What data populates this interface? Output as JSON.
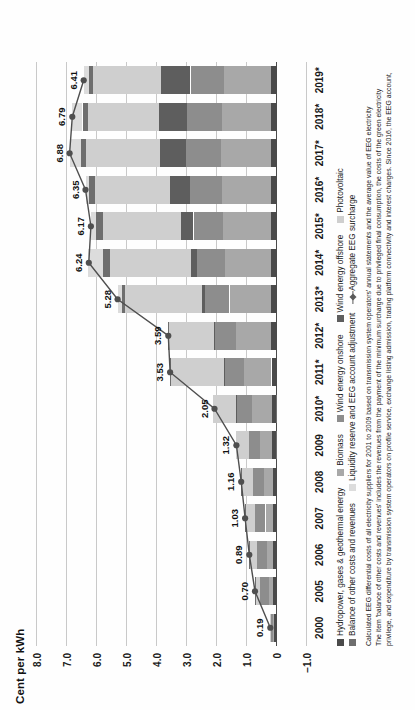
{
  "axis_title": "Cent per kWh",
  "legend": {
    "rows": [
      [
        {
          "label": "Hydropower, gases & geothermal energy",
          "color": "#4a4a4a",
          "type": "swatch"
        },
        {
          "label": "Biomass",
          "color": "#a8a8a8",
          "type": "swatch"
        },
        {
          "label": "Wind energy onshore",
          "color": "#8d8d8d",
          "type": "swatch"
        },
        {
          "label": "Wind energy offshore",
          "color": "#5e5e5e",
          "type": "swatch"
        },
        {
          "label": "Photovoltaic",
          "color": "#cfcfcf",
          "type": "swatch"
        }
      ],
      [
        {
          "label": "Balance of other costs and revenues",
          "color": "#6e6e6e",
          "type": "swatch"
        },
        {
          "label": "Liquidity reserve and EEG account adjustment",
          "color": "#dcdcdc",
          "type": "swatch"
        },
        {
          "label": "Aggregate EEG surcharge",
          "color": "#5a5a5a",
          "type": "diamond"
        }
      ]
    ]
  },
  "footnote": {
    "line1": "Calculated EEG differential costs of all electricity suppliers for 2001 to 2009 based on transmission system operators' annual statements and the average value of EEG electricity",
    "line2": "The item 'balance of other costs and revenues' includes the revenues from the payment of the minimum surcharge due to privileged final consumption, the costs of the green electricity",
    "line3": "privilege, and expenditure by transmission system operators on profile service, exchange listing admission, trading platform connectivity and interest charges. Since 2016, the EEG account,"
  },
  "chart_data": {
    "type": "bar",
    "title": "Cent per kWh",
    "xlabel": "",
    "ylabel": "Cent per kWh",
    "ylim": [
      -1.0,
      8.0
    ],
    "yticks": [
      "8.0",
      "7.0",
      "6.0",
      "5.0",
      "4.0",
      "3.0",
      "2.0",
      "1.0",
      "0",
      "−1.0"
    ],
    "ytick_values": [
      8.0,
      7.0,
      6.0,
      5.0,
      4.0,
      3.0,
      2.0,
      1.0,
      0,
      -1.0
    ],
    "grid": true,
    "legend_position": "below",
    "categories": [
      "2000",
      "2005",
      "2006",
      "2007",
      "2008",
      "2009",
      "2010*",
      "2011*",
      "2012*",
      "2013*",
      "2014*",
      "2015*",
      "2016*",
      "2017*",
      "2018*",
      "2019*"
    ],
    "series": [
      {
        "name": "Hydropower, gases & geothermal energy",
        "color": "#4a4a4a",
        "values": [
          0.06,
          0.1,
          0.11,
          0.11,
          0.11,
          0.12,
          0.14,
          0.15,
          0.16,
          0.17,
          0.18,
          0.18,
          0.18,
          0.18,
          0.18,
          0.17
        ]
      },
      {
        "name": "Biomass",
        "color": "#a8a8a8",
        "values": [
          0.03,
          0.14,
          0.19,
          0.24,
          0.3,
          0.41,
          0.65,
          0.93,
          1.16,
          1.38,
          1.52,
          1.6,
          1.63,
          1.64,
          1.62,
          1.58
        ]
      },
      {
        "name": "Wind energy onshore",
        "color": "#8d8d8d",
        "values": [
          0.09,
          0.3,
          0.34,
          0.36,
          0.36,
          0.38,
          0.52,
          0.63,
          0.71,
          0.82,
          0.92,
          0.97,
          1.06,
          1.18,
          1.16,
          1.1
        ]
      },
      {
        "name": "Wind energy offshore",
        "color": "#5e5e5e",
        "values": [
          0.0,
          0.0,
          0.0,
          0.0,
          0.0,
          0.0,
          0.01,
          0.02,
          0.05,
          0.11,
          0.22,
          0.41,
          0.66,
          0.86,
          0.94,
          0.98
        ]
      },
      {
        "name": "Photovoltaic",
        "color": "#cfcfcf",
        "values": [
          0.01,
          0.13,
          0.22,
          0.3,
          0.37,
          0.44,
          0.77,
          1.77,
          1.49,
          2.55,
          2.7,
          2.6,
          2.52,
          2.46,
          2.38,
          2.26
        ]
      },
      {
        "name": "Balance of other costs and revenues",
        "color": "#6e6e6e",
        "values": [
          0.0,
          0.03,
          0.03,
          0.02,
          0.02,
          -0.03,
          -0.04,
          0.03,
          0.02,
          0.1,
          0.22,
          0.25,
          0.2,
          0.18,
          0.17,
          0.15
        ]
      },
      {
        "name": "Liquidity reserve and EEG account adjustment",
        "color": "#dcdcdc",
        "values": [
          0.0,
          0.0,
          0.0,
          0.0,
          0.0,
          0.0,
          0.0,
          0.0,
          0.0,
          0.15,
          0.5,
          0.16,
          0.1,
          0.38,
          0.34,
          0.17
        ]
      }
    ],
    "line_series": {
      "name": "Aggregate EEG surcharge",
      "color": "#4f4f4f",
      "values": [
        0.19,
        0.7,
        0.89,
        1.03,
        1.16,
        1.32,
        2.05,
        3.53,
        3.59,
        5.28,
        6.24,
        6.17,
        6.35,
        6.88,
        6.79,
        6.41
      ],
      "labels": [
        "0.19",
        "0.70",
        "0.89",
        "1.03",
        "1.16",
        "1.32",
        "2.05",
        "3.53",
        "3.59",
        "5.28",
        "6.24",
        "6.17",
        "6.35",
        "6.88",
        "6.79",
        "6.41"
      ]
    }
  }
}
